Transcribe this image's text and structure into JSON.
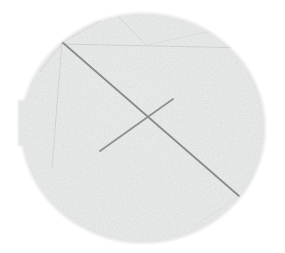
{
  "image": {
    "title": "Grey textured disc with crossed scribed lines",
    "width": 285,
    "height": 253,
    "background_color": "#ffffff",
    "subject": "circular disc specimen"
  },
  "disc": {
    "name": "circular disc",
    "center_x": 143,
    "center_y": 128,
    "radius_x": 122,
    "radius_y": 115,
    "fill_color": "#eceded",
    "edge_color": "#dfe0e0",
    "texture": "fine mottled granular speckle",
    "top_edge_y": 13,
    "bottom_edge_y": 243,
    "left_edge_x": 21,
    "right_edge_x": 265
  },
  "tab": {
    "name": "left edge tab",
    "x": 18,
    "y": 100,
    "width": 10,
    "height": 46,
    "fill_color": "#e4e5e5"
  },
  "marks": {
    "primary_line_color": "#8a8c8c",
    "faint_line_color": "#d3d5d5",
    "lines": [
      {
        "name": "long-diagonal",
        "x1": 62,
        "y1": 42,
        "x2": 239,
        "y2": 196,
        "width": 1.8,
        "color": "#8a8c8c",
        "emphasis": "primary"
      },
      {
        "name": "short-diagonal",
        "x1": 100,
        "y1": 151,
        "x2": 173,
        "y2": 99,
        "width": 1.8,
        "color": "#8f9191",
        "emphasis": "primary"
      },
      {
        "name": "top-chord",
        "x1": 60,
        "y1": 44,
        "x2": 251,
        "y2": 48,
        "width": 1.0,
        "color": "#cfd1d1",
        "emphasis": "faint"
      },
      {
        "name": "left-vertical-chord",
        "x1": 62,
        "y1": 42,
        "x2": 52,
        "y2": 168,
        "width": 1.0,
        "color": "#d2d4d4",
        "emphasis": "faint"
      },
      {
        "name": "upper-left-facet",
        "x1": 40,
        "y1": 72,
        "x2": 64,
        "y2": 41,
        "width": 1.0,
        "color": "#d6d8d8",
        "emphasis": "faint"
      },
      {
        "name": "apex-left-facet",
        "x1": 100,
        "y1": 21,
        "x2": 62,
        "y2": 43,
        "width": 1.0,
        "color": "#d8dada",
        "emphasis": "faint"
      },
      {
        "name": "apex-right-facet",
        "x1": 118,
        "y1": 16,
        "x2": 146,
        "y2": 45,
        "width": 1.0,
        "color": "#d5d7d7",
        "emphasis": "faint"
      },
      {
        "name": "upper-right-facet",
        "x1": 146,
        "y1": 45,
        "x2": 226,
        "y2": 28,
        "width": 1.0,
        "color": "#d9dbdb",
        "emphasis": "faint"
      },
      {
        "name": "right-facet",
        "x1": 251,
        "y1": 48,
        "x2": 261,
        "y2": 83,
        "width": 1.0,
        "color": "#dadcdc",
        "emphasis": "faint"
      },
      {
        "name": "lower-right-chord",
        "x1": 239,
        "y1": 196,
        "x2": 196,
        "y2": 225,
        "width": 1.0,
        "color": "#dcdede",
        "emphasis": "faint"
      }
    ]
  }
}
